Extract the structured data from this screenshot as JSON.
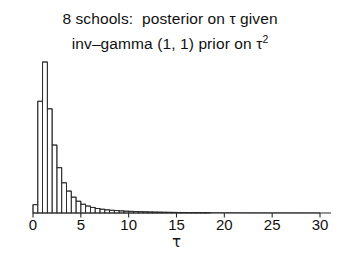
{
  "figure": {
    "width": 340,
    "height": 257,
    "background": "#ffffff",
    "ink_color": "#2a2a2a",
    "text_color": "#111111"
  },
  "title": {
    "line1": "8 schools:  posterior on τ given",
    "line2_pre": "inv–gamma (1, 1) prior on τ",
    "line2_sup": "2"
  },
  "axis": {
    "xlabel": "τ",
    "tick_labels": [
      "0",
      "5",
      "10",
      "15",
      "20",
      "25",
      "30"
    ],
    "tick_values": [
      0,
      5,
      10,
      15,
      20,
      25,
      30
    ],
    "baseline_y": 213,
    "x_pixel_min": 33,
    "x_pixel_max": 320
  },
  "chart_data": {
    "type": "bar",
    "xlabel": "τ",
    "ylabel": "",
    "xlim": [
      0,
      30
    ],
    "ylim": [
      0,
      1
    ],
    "grid": false,
    "legend": null,
    "note": "Histogram of posterior simulation draws of tau; density scaled so the modal bin equals 1. Bin width 0.5 on the tau axis.",
    "bin_width": 0.5,
    "bin_starts": [
      0.0,
      0.5,
      1.0,
      1.5,
      2.0,
      2.5,
      3.0,
      3.5,
      4.0,
      4.5,
      5.0,
      5.5,
      6.0,
      6.5,
      7.0,
      7.5,
      8.0,
      8.5,
      9.0,
      9.5,
      10.0,
      10.5,
      11.0,
      11.5,
      12.0,
      12.5,
      13.0,
      13.5,
      14.0,
      14.5,
      15.0,
      15.5,
      16.0,
      16.5,
      17.0,
      17.5,
      18.0,
      18.5,
      19.0,
      19.5,
      20.0,
      20.5,
      21.0,
      21.5,
      22.0,
      22.5,
      23.0,
      23.5,
      24.0,
      24.5,
      25.0,
      25.5,
      26.0,
      26.5,
      27.0,
      27.5,
      28.0,
      28.5,
      29.0,
      29.5
    ],
    "categories": [
      "0.25",
      "0.75",
      "1.25",
      "1.75",
      "2.25",
      "2.75",
      "3.25",
      "3.75",
      "4.25",
      "4.75",
      "5.25",
      "5.75",
      "6.25",
      "6.75",
      "7.25",
      "7.75",
      "8.25",
      "8.75",
      "9.25",
      "9.75",
      "10.25",
      "10.75",
      "11.25",
      "11.75",
      "12.25",
      "12.75",
      "13.25",
      "13.75",
      "14.25",
      "14.75",
      "15.25",
      "15.75",
      "16.25",
      "16.75",
      "17.25",
      "17.75",
      "18.25",
      "18.75",
      "19.25",
      "19.75",
      "20.25",
      "20.75",
      "21.25",
      "21.75",
      "22.25",
      "22.75",
      "23.25",
      "23.75",
      "24.25",
      "24.75",
      "25.25",
      "25.75",
      "26.25",
      "26.75",
      "27.25",
      "27.75",
      "28.25",
      "28.75",
      "29.25",
      "29.75"
    ],
    "values": [
      0.055,
      0.74,
      1.0,
      0.69,
      0.45,
      0.3,
      0.2,
      0.145,
      0.105,
      0.078,
      0.058,
      0.046,
      0.037,
      0.03,
      0.025,
      0.021,
      0.018,
      0.016,
      0.014,
      0.012,
      0.011,
      0.0095,
      0.0085,
      0.0075,
      0.0068,
      0.006,
      0.0055,
      0.005,
      0.0045,
      0.0042,
      0.0038,
      0.0035,
      0.0032,
      0.003,
      0.0028,
      0.0026,
      0.0024,
      0.0022,
      0.0021,
      0.002,
      0.0019,
      0.0018,
      0.0017,
      0.0016,
      0.0015,
      0.0014,
      0.0013,
      0.0013,
      0.0012,
      0.0011,
      0.0011,
      0.001,
      0.001,
      0.0009,
      0.0009,
      0.0008,
      0.0008,
      0.0007,
      0.0007,
      0.0006
    ]
  }
}
